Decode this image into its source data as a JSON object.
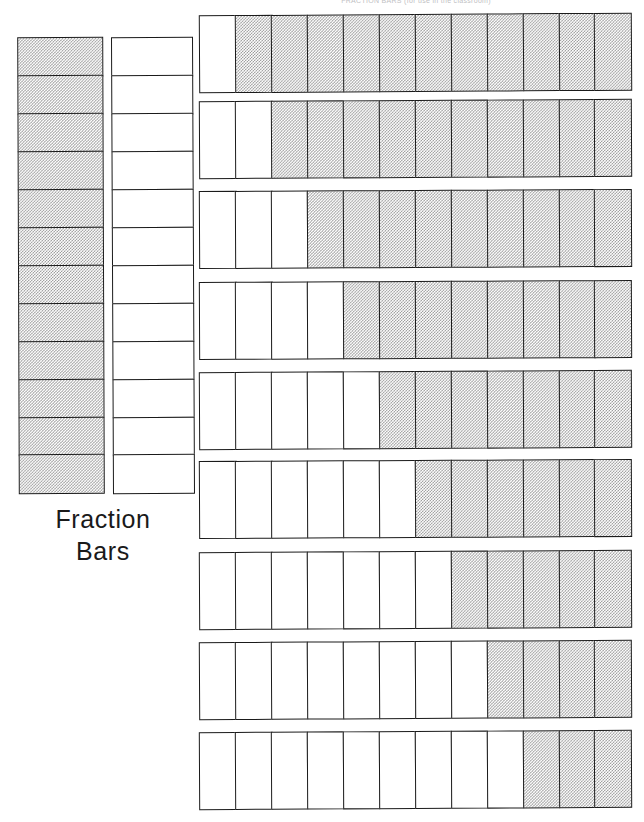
{
  "page": {
    "title": "Fraction Bars",
    "header_scrap": "FRACTION BARS   (for use in the classroom)",
    "background_color": "#ffffff",
    "ink_color": "#1a1a1a",
    "shade_color": "#9a9a9a"
  },
  "caption": {
    "line1": "Fraction",
    "line2": "Bars"
  },
  "chart_data": {
    "type": "bar",
    "title": "Fraction Bars",
    "xlabel": "",
    "ylabel": "",
    "denominator": 12,
    "segments_per_bar": 12,
    "vertical_bars": [
      {
        "name": "twelfths-whole-shaded",
        "orientation": "vertical",
        "segments": 12,
        "shaded": 12,
        "unshaded": 0,
        "fraction": "12/12",
        "value": 1.0,
        "pattern": [
          "shaded",
          "shaded",
          "shaded",
          "shaded",
          "shaded",
          "shaded",
          "shaded",
          "shaded",
          "shaded",
          "shaded",
          "shaded",
          "shaded"
        ]
      },
      {
        "name": "twelfths-whole-empty",
        "orientation": "vertical",
        "segments": 12,
        "shaded": 0,
        "unshaded": 12,
        "fraction": "0/12",
        "value": 0.0,
        "pattern": [
          "empty",
          "empty",
          "empty",
          "empty",
          "empty",
          "empty",
          "empty",
          "empty",
          "empty",
          "empty",
          "empty",
          "empty"
        ]
      }
    ],
    "horizontal_bars": [
      {
        "name": "eleven-twelfths",
        "orientation": "horizontal",
        "segments": 12,
        "unshaded_leading": 1,
        "shaded": 11,
        "fraction": "11/12",
        "value": 0.9167,
        "pattern": [
          "empty",
          "shaded",
          "shaded",
          "shaded",
          "shaded",
          "shaded",
          "shaded",
          "shaded",
          "shaded",
          "shaded",
          "shaded",
          "shaded"
        ]
      },
      {
        "name": "ten-twelfths",
        "orientation": "horizontal",
        "segments": 12,
        "unshaded_leading": 2,
        "shaded": 10,
        "fraction": "10/12",
        "value": 0.8333,
        "pattern": [
          "empty",
          "empty",
          "shaded",
          "shaded",
          "shaded",
          "shaded",
          "shaded",
          "shaded",
          "shaded",
          "shaded",
          "shaded",
          "shaded"
        ]
      },
      {
        "name": "nine-twelfths",
        "orientation": "horizontal",
        "segments": 12,
        "unshaded_leading": 3,
        "shaded": 9,
        "fraction": "9/12",
        "value": 0.75,
        "pattern": [
          "empty",
          "empty",
          "empty",
          "shaded",
          "shaded",
          "shaded",
          "shaded",
          "shaded",
          "shaded",
          "shaded",
          "shaded",
          "shaded"
        ]
      },
      {
        "name": "eight-twelfths",
        "orientation": "horizontal",
        "segments": 12,
        "unshaded_leading": 4,
        "shaded": 8,
        "fraction": "8/12",
        "value": 0.6667,
        "pattern": [
          "empty",
          "empty",
          "empty",
          "empty",
          "shaded",
          "shaded",
          "shaded",
          "shaded",
          "shaded",
          "shaded",
          "shaded",
          "shaded"
        ]
      },
      {
        "name": "seven-twelfths",
        "orientation": "horizontal",
        "segments": 12,
        "unshaded_leading": 5,
        "shaded": 7,
        "fraction": "7/12",
        "value": 0.5833,
        "pattern": [
          "empty",
          "empty",
          "empty",
          "empty",
          "empty",
          "shaded",
          "shaded",
          "shaded",
          "shaded",
          "shaded",
          "shaded",
          "shaded"
        ]
      },
      {
        "name": "six-twelfths",
        "orientation": "horizontal",
        "segments": 12,
        "unshaded_leading": 6,
        "shaded": 6,
        "fraction": "6/12",
        "value": 0.5,
        "pattern": [
          "empty",
          "empty",
          "empty",
          "empty",
          "empty",
          "empty",
          "shaded",
          "shaded",
          "shaded",
          "shaded",
          "shaded",
          "shaded"
        ]
      },
      {
        "name": "five-twelfths",
        "orientation": "horizontal",
        "segments": 12,
        "unshaded_leading": 7,
        "shaded": 5,
        "fraction": "5/12",
        "value": 0.4167,
        "pattern": [
          "empty",
          "empty",
          "empty",
          "empty",
          "empty",
          "empty",
          "empty",
          "shaded",
          "shaded",
          "shaded",
          "shaded",
          "shaded"
        ]
      },
      {
        "name": "four-twelfths",
        "orientation": "horizontal",
        "segments": 12,
        "unshaded_leading": 8,
        "shaded": 4,
        "fraction": "4/12",
        "value": 0.3333,
        "pattern": [
          "empty",
          "empty",
          "empty",
          "empty",
          "empty",
          "empty",
          "empty",
          "empty",
          "shaded",
          "shaded",
          "shaded",
          "shaded"
        ]
      },
      {
        "name": "three-twelfths",
        "orientation": "horizontal",
        "segments": 12,
        "unshaded_leading": 9,
        "shaded": 3,
        "fraction": "3/12",
        "value": 0.25,
        "pattern": [
          "empty",
          "empty",
          "empty",
          "empty",
          "empty",
          "empty",
          "empty",
          "empty",
          "empty",
          "shaded",
          "shaded",
          "shaded"
        ]
      }
    ]
  }
}
